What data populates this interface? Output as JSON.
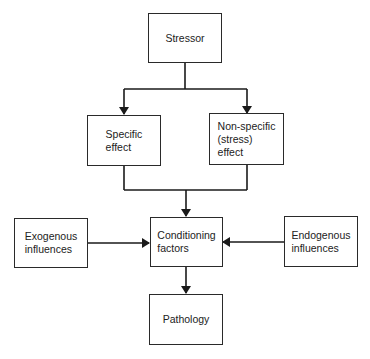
{
  "diagram": {
    "type": "flowchart",
    "colors": {
      "line": "#1a1a1a",
      "box_border": "#2a2a2a",
      "text": "#222222",
      "background": "#ffffff"
    },
    "nodes": {
      "stressor": {
        "label": "Stressor"
      },
      "specific": {
        "label": "Specific\neffect"
      },
      "nonspecific": {
        "label": "Non-specific\n(stress)\neffect"
      },
      "conditioning": {
        "label": "Conditioning\nfactors"
      },
      "exogenous": {
        "label": "Exogenous\ninfluences"
      },
      "endogenous": {
        "label": "Endogenous\ninfluences"
      },
      "pathology": {
        "label": "Pathology"
      }
    },
    "edges": [
      {
        "from": "stressor",
        "to": "specific"
      },
      {
        "from": "stressor",
        "to": "nonspecific"
      },
      {
        "from": "specific",
        "to": "conditioning"
      },
      {
        "from": "nonspecific",
        "to": "conditioning"
      },
      {
        "from": "exogenous",
        "to": "conditioning"
      },
      {
        "from": "endogenous",
        "to": "conditioning"
      },
      {
        "from": "conditioning",
        "to": "pathology"
      }
    ]
  }
}
